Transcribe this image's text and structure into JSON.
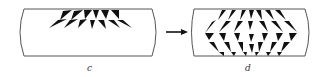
{
  "figure": {
    "panels": [
      {
        "id": "c",
        "label": "c",
        "description": "Initial state: two rows of triangles converging near the top edge"
      },
      {
        "id": "d",
        "label": "d",
        "description": "Later state: diamond/chevron pattern of triangles filling panel"
      }
    ],
    "arrow": {
      "direction": "right"
    },
    "colors": {
      "stroke": "#555555",
      "fill": "#111111",
      "label": "#333333",
      "background": "#ffffff"
    }
  }
}
